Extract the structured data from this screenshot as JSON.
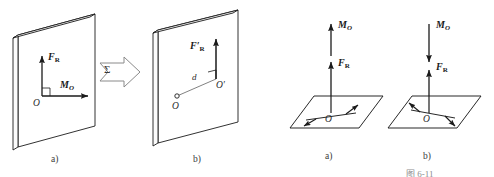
{
  "figure": {
    "background_color": "#ffffff",
    "stroke_color": "#1b1b1b",
    "caption_partial": "图 6-11"
  },
  "panels": [
    {
      "id": "plate-a",
      "caption": "a)",
      "description": "Inclined rectangular plate with resultant force and couple moment at point O",
      "plane_label": "Σ",
      "origin_label": "O",
      "vectors": [
        {
          "name": "resultant-force",
          "base": "F",
          "subscript": "R",
          "prime": false,
          "direction": "up"
        },
        {
          "name": "couple-moment",
          "base": "M",
          "subscript": "O",
          "prime": false,
          "direction": "right"
        }
      ],
      "right_angle_mark": true
    },
    {
      "id": "transition-arrow",
      "icon": "block-arrow-right-icon",
      "description": "Hollow block arrow indicating equivalence transformation"
    },
    {
      "id": "plate-b",
      "caption": "b)",
      "description": "Same plate with single resultant force shifted to point O prime at distance d",
      "origin_label": "O",
      "shifted_point_label": "O′",
      "distance_label": "d",
      "vectors": [
        {
          "name": "shifted-resultant-force",
          "base": "F",
          "subscript": "R",
          "prime": true,
          "direction": "up"
        }
      ],
      "right_angle_mark": true
    },
    {
      "id": "plane-a",
      "caption": "a)",
      "description": "Horizontal plane with resultant force up and couple moment vector up (same sense)",
      "origin_label": "O",
      "vectors": [
        {
          "name": "couple-moment",
          "base": "M",
          "subscript": "O",
          "prime": false,
          "direction": "up"
        },
        {
          "name": "resultant-force",
          "base": "F",
          "subscript": "R",
          "prime": false,
          "direction": "up"
        }
      ],
      "couple_arrows": "counterclockwise-pair"
    },
    {
      "id": "plane-b",
      "caption": "b)",
      "description": "Horizontal plane with resultant force up and couple moment vector down (opposite sense)",
      "origin_label": "O",
      "vectors": [
        {
          "name": "couple-moment",
          "base": "M",
          "subscript": "O",
          "prime": false,
          "direction": "down"
        },
        {
          "name": "resultant-force",
          "base": "F",
          "subscript": "R",
          "prime": false,
          "direction": "up"
        }
      ],
      "couple_arrows": "clockwise-pair"
    }
  ],
  "labels": {
    "F_R": "F",
    "F_R_sub": "R",
    "M_O": "M",
    "M_O_sub": "O",
    "prime_mark": "′",
    "point_O": "O",
    "point_O_prime": "O′",
    "distance_d": "d",
    "sigma": "Σ",
    "caption_a": "a)",
    "caption_b": "b)",
    "figure_number": "图 6-11"
  }
}
